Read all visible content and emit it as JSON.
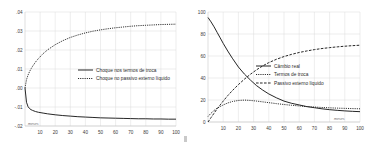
{
  "figure": {
    "panels": [
      "left",
      "right"
    ]
  },
  "chart_data": [
    {
      "id": "left",
      "type": "line",
      "title": "",
      "xlabel": "meses",
      "ylabel": "",
      "xlim": [
        0,
        100
      ],
      "ylim": [
        -0.02,
        0.04
      ],
      "grid": true,
      "legend_position": "center-right",
      "xticks": [
        10,
        20,
        30,
        40,
        50,
        60,
        70,
        80,
        90,
        100
      ],
      "xtick_labels": [
        "10",
        "20",
        "30",
        "40",
        "50",
        "60",
        "70",
        "80",
        "90",
        "100"
      ],
      "yticks": [
        0.04,
        0.03,
        0.02,
        0.01,
        0.0,
        -0.01,
        -0.02
      ],
      "ytick_labels": [
        ".04",
        ".03",
        ".02",
        ".01",
        ".00",
        "-.01",
        "-.02"
      ],
      "x": [
        0,
        1,
        2,
        3,
        4,
        5,
        7,
        9,
        12,
        15,
        20,
        25,
        30,
        35,
        40,
        45,
        50,
        55,
        60,
        65,
        70,
        75,
        80,
        85,
        90,
        95,
        100
      ],
      "series": [
        {
          "name": "Choque nos termos de troca",
          "style": "solid",
          "values": [
            0.0,
            -0.0075,
            -0.0098,
            -0.0108,
            -0.0114,
            -0.0118,
            -0.0124,
            -0.0128,
            -0.0132,
            -0.0136,
            -0.0141,
            -0.0145,
            -0.0148,
            -0.0151,
            -0.0153,
            -0.0155,
            -0.0157,
            -0.0158,
            -0.0159,
            -0.016,
            -0.0161,
            -0.0162,
            -0.0162,
            -0.0163,
            -0.0163,
            -0.0164,
            -0.0164
          ]
        },
        {
          "name": "Choque no passivo externo líquido",
          "style": "dotted",
          "values": [
            0.0,
            0.0044,
            0.0068,
            0.0086,
            0.0101,
            0.0114,
            0.0137,
            0.0156,
            0.0181,
            0.0201,
            0.0228,
            0.0249,
            0.0266,
            0.0279,
            0.029,
            0.0299,
            0.0306,
            0.0312,
            0.0317,
            0.0321,
            0.0325,
            0.0328,
            0.033,
            0.0332,
            0.0334,
            0.0335,
            0.0336
          ]
        }
      ]
    },
    {
      "id": "right",
      "type": "line",
      "title": "",
      "xlabel": "meses",
      "ylabel": "",
      "xlim": [
        0,
        100
      ],
      "ylim": [
        0,
        100
      ],
      "grid": true,
      "legend_position": "center-right",
      "xticks": [
        10,
        20,
        30,
        40,
        50,
        60,
        70,
        80,
        90,
        100
      ],
      "xtick_labels": [
        "10",
        "20",
        "30",
        "40",
        "50",
        "60",
        "70",
        "80",
        "90",
        "100"
      ],
      "yticks": [
        100,
        80,
        60,
        40,
        20,
        0
      ],
      "ytick_labels": [
        "100",
        "80",
        "60",
        "40",
        "20",
        "0"
      ],
      "x": [
        0,
        2,
        4,
        6,
        8,
        10,
        13,
        16,
        20,
        24,
        28,
        32,
        36,
        40,
        45,
        50,
        55,
        60,
        65,
        70,
        75,
        80,
        85,
        90,
        95,
        100
      ],
      "series": [
        {
          "name": "Câmbio real",
          "style": "solid",
          "values": [
            95.0,
            91.0,
            86.5,
            81.5,
            76.5,
            71.5,
            64.5,
            58.0,
            50.0,
            43.5,
            38.0,
            33.0,
            29.0,
            25.5,
            22.0,
            19.0,
            17.0,
            15.5,
            14.0,
            13.0,
            12.0,
            11.2,
            10.6,
            10.1,
            9.7,
            9.4
          ]
        },
        {
          "name": "Termos de troca",
          "style": "dotted",
          "values": [
            5.0,
            8.0,
            10.5,
            12.5,
            14.0,
            15.5,
            17.3,
            18.6,
            19.6,
            19.9,
            19.6,
            19.0,
            18.3,
            17.6,
            16.7,
            15.9,
            15.2,
            14.6,
            14.0,
            13.6,
            13.2,
            12.9,
            12.6,
            12.4,
            12.2,
            12.0
          ]
        },
        {
          "name": "Passivo externo líquido",
          "style": "dashed",
          "values": [
            0.0,
            4.0,
            8.0,
            12.0,
            15.5,
            19.0,
            24.0,
            28.5,
            34.0,
            39.0,
            43.5,
            47.5,
            51.0,
            54.0,
            57.0,
            59.5,
            61.5,
            63.2,
            64.6,
            65.8,
            66.8,
            67.6,
            68.3,
            68.9,
            69.4,
            69.8
          ]
        }
      ]
    }
  ]
}
